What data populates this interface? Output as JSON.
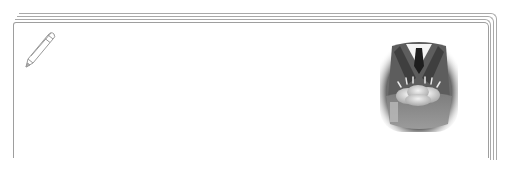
{
  "note_card": {
    "icons": {
      "pencil": "pencil-icon"
    },
    "illustration": {
      "subject": "suited-figure-holding-bread-pouch",
      "style": "grayscale"
    },
    "colors": {
      "border": "#a9a9a9",
      "background": "#ffffff",
      "suit_dark": "#3a3a3a",
      "suit_mid": "#6e6e6e",
      "bread": "#d9d9d9"
    }
  }
}
